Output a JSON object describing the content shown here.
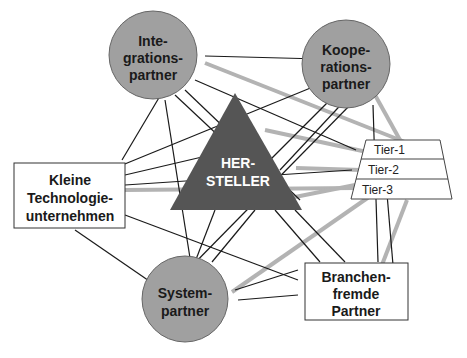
{
  "diagram": {
    "center": {
      "label_lines": [
        "HER-",
        "STELLER"
      ],
      "shape": "triangle",
      "color": "#555555"
    },
    "nodes": {
      "integration": {
        "label_lines": [
          "Inte-",
          "grations-",
          "partner"
        ],
        "shape": "circle",
        "color": "#a0a0a0"
      },
      "cooperation": {
        "label_lines": [
          "Koope-",
          "rations-",
          "partner"
        ],
        "shape": "circle",
        "color": "#a0a0a0"
      },
      "system": {
        "label_lines": [
          "System-",
          "partner"
        ],
        "shape": "circle",
        "color": "#a0a0a0"
      },
      "small_tech": {
        "label_lines": [
          "Kleine",
          "Technologie-",
          "unternehmen"
        ],
        "shape": "rectangle"
      },
      "foreign_industry": {
        "label_lines": [
          "Branchen-",
          "fremde",
          "Partner"
        ],
        "shape": "rectangle"
      },
      "tiers": {
        "label_lines": [
          "Tier-1",
          "Tier-2",
          "Tier-3"
        ],
        "shape": "trapezoid"
      }
    },
    "colors": {
      "thin_line": "#1a1a1a",
      "thick_line": "#b3b3b3"
    }
  }
}
